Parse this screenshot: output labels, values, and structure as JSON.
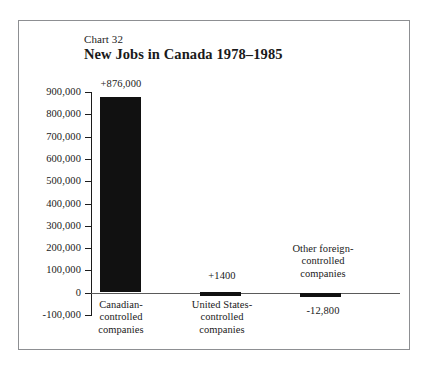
{
  "figure": {
    "chart_number": "Chart 32",
    "title": "New Jobs in Canada 1978–1985",
    "frame_color": "#8d8f92",
    "bar_color": "#111111",
    "axis_color": "#1d1d1d",
    "background": "#ffffff"
  },
  "axis": {
    "tick_labels": [
      "900,000",
      "800,000",
      "700,000",
      "600,000",
      "500,000",
      "400,000",
      "300,000",
      "200,000",
      "100,000",
      "0",
      "-100,000"
    ]
  },
  "bars": {
    "b0": {
      "value_label": "+876,000",
      "caption_line1": "Canadian-",
      "caption_line2": "controlled",
      "caption_line3": "companies"
    },
    "b1": {
      "value_label": "+1400",
      "caption_line1": "United States-",
      "caption_line2": "controlled",
      "caption_line3": "companies"
    },
    "b2": {
      "value_label": "-12,800",
      "caption_line1": "Other foreign-",
      "caption_line2": "controlled",
      "caption_line3": "companies"
    }
  },
  "chart_data": {
    "type": "bar",
    "title": "New Jobs in Canada 1978–1985",
    "subtitle": "Chart 32",
    "xlabel": "",
    "ylabel": "",
    "categories": [
      "Canadian-controlled companies",
      "United States-controlled companies",
      "Other foreign-controlled companies"
    ],
    "values": [
      876000,
      1400,
      -12800
    ],
    "data_labels": [
      "+876,000",
      "+1400",
      "-12,800"
    ],
    "ylim": [
      -100000,
      900000
    ],
    "ytick_step": 100000,
    "yticks": [
      900000,
      800000,
      700000,
      600000,
      500000,
      400000,
      300000,
      200000,
      100000,
      0,
      -100000
    ],
    "ytick_labels": [
      "900,000",
      "800,000",
      "700,000",
      "600,000",
      "500,000",
      "400,000",
      "300,000",
      "200,000",
      "100,000",
      "0",
      "-100,000"
    ],
    "grid": false,
    "legend": false,
    "bar_color": "#111111",
    "orientation": "vertical"
  }
}
